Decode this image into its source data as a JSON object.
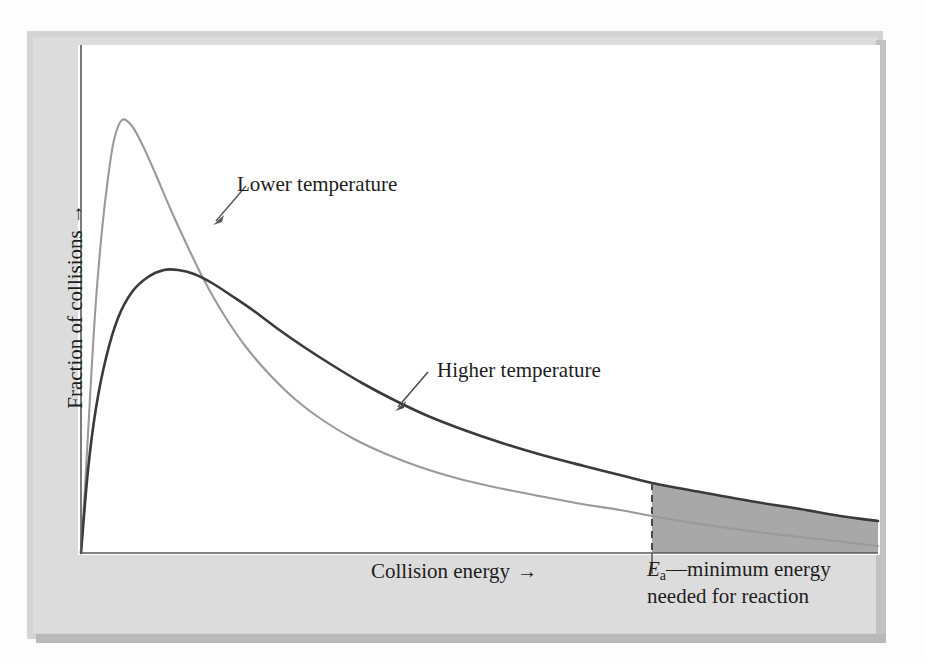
{
  "figure": {
    "kind": "scientific-diagram"
  },
  "labels": {
    "lower_temperature": "Lower temperature",
    "higher_temperature": "Higher temperature",
    "x_axis": "Collision energy",
    "x_axis_arrow": "→",
    "y_axis": "Fraction of collisions",
    "y_axis_arrow": "→",
    "activation_symbol": "E",
    "activation_subscript": "a",
    "activation_text": "—minimum energy needed for reaction"
  },
  "colors": {
    "mat": "#d4d4d4",
    "mat_inner": "#dcdcdc",
    "canvas": "#ffffff",
    "axis": "#5a5a5a",
    "lower_curve": "#9a9a9a",
    "higher_curve": "#3a3a3a",
    "shaded_region": "#a8a8a8",
    "dashed_line": "#4a4a4a",
    "text": "#1d1d1d"
  },
  "chart_data": {
    "type": "line",
    "title": "",
    "xlabel": "Collision energy",
    "ylabel": "Fraction of collisions",
    "xlim": [
      0,
      100
    ],
    "ylim": [
      0,
      100
    ],
    "grid": false,
    "legend": "inline-annotations",
    "axis_ticks": "none",
    "annotations": [
      {
        "name": "lower-temperature-callout",
        "text": "Lower temperature",
        "label_xy": [
          237,
          172
        ],
        "points_to_xy": [
          218,
          220
        ]
      },
      {
        "name": "higher-temperature-callout",
        "text": "Higher temperature",
        "label_xy": [
          437,
          358
        ],
        "points_to_xy": [
          398,
          406
        ]
      },
      {
        "name": "activation-energy-marker",
        "text": "Ea—minimum energy needed for reaction",
        "x_position": 652,
        "style": "dashed-vertical-line"
      }
    ],
    "shaded_region": {
      "name": "molecules-exceeding-activation-energy",
      "from_x": 652,
      "to_x": 878,
      "bounded_above_by": "higher-temperature-curve",
      "bounded_below_by": "x-axis",
      "fill": "#a8a8a8"
    },
    "series": [
      {
        "name": "Lower temperature",
        "color": "#9a9a9a",
        "peak_xy": [
          122,
          120
        ],
        "points": [
          [
            81,
            553
          ],
          [
            86,
            470
          ],
          [
            91,
            380
          ],
          [
            96,
            300
          ],
          [
            102,
            230
          ],
          [
            108,
            178
          ],
          [
            114,
            140
          ],
          [
            122,
            120
          ],
          [
            132,
            126
          ],
          [
            143,
            146
          ],
          [
            156,
            175
          ],
          [
            170,
            208
          ],
          [
            186,
            243
          ],
          [
            204,
            280
          ],
          [
            224,
            315
          ],
          [
            246,
            347
          ],
          [
            270,
            375
          ],
          [
            296,
            400
          ],
          [
            324,
            421
          ],
          [
            354,
            439
          ],
          [
            386,
            454
          ],
          [
            420,
            467
          ],
          [
            456,
            478
          ],
          [
            494,
            487
          ],
          [
            534,
            495
          ],
          [
            576,
            503
          ],
          [
            620,
            510
          ],
          [
            652,
            516
          ],
          [
            700,
            524
          ],
          [
            750,
            531
          ],
          [
            800,
            537
          ],
          [
            878,
            546
          ]
        ]
      },
      {
        "name": "Higher temperature",
        "color": "#3a3a3a",
        "peak_xy": [
          178,
          270
        ],
        "points": [
          [
            81,
            553
          ],
          [
            88,
            470
          ],
          [
            96,
            408
          ],
          [
            106,
            358
          ],
          [
            118,
            318
          ],
          [
            132,
            292
          ],
          [
            148,
            277
          ],
          [
            164,
            270
          ],
          [
            178,
            270
          ],
          [
            194,
            274
          ],
          [
            212,
            283
          ],
          [
            232,
            296
          ],
          [
            254,
            311
          ],
          [
            278,
            329
          ],
          [
            304,
            347
          ],
          [
            332,
            365
          ],
          [
            362,
            383
          ],
          [
            394,
            400
          ],
          [
            428,
            416
          ],
          [
            464,
            430
          ],
          [
            502,
            443
          ],
          [
            542,
            455
          ],
          [
            584,
            466
          ],
          [
            628,
            477
          ],
          [
            652,
            483
          ],
          [
            700,
            492
          ],
          [
            750,
            501
          ],
          [
            800,
            509
          ],
          [
            840,
            516
          ],
          [
            878,
            521
          ]
        ]
      }
    ],
    "curve_crossing_xy": [
      278,
      340
    ]
  },
  "geometry": {
    "plot_left": 81,
    "plot_right": 878,
    "plot_top": 45,
    "plot_bottom": 553
  }
}
